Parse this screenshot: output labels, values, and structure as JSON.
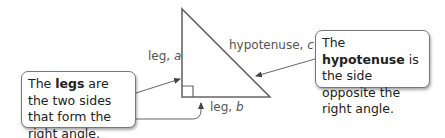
{
  "triangle": {
    "labels": {
      "leg_a_prefix": "leg, ",
      "leg_a_var": "a",
      "leg_b_prefix": "leg, ",
      "leg_b_var": "b",
      "hypotenuse_prefix": "hypotenuse, ",
      "hypotenuse_var": "c"
    }
  },
  "callouts": {
    "legs": {
      "before": "The ",
      "term": "legs",
      "after": " are the two sides that form the right angle."
    },
    "hypotenuse": {
      "before": "The ",
      "term": "hypotenuse",
      "after": " is the side opposite the right angle."
    }
  },
  "colors": {
    "line": "#666666",
    "label_text": "#555555",
    "callout_text": "#222222",
    "callout_border": "#777777"
  }
}
